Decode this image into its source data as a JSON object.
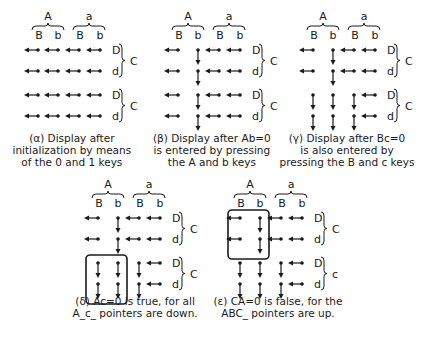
{
  "colors": {
    "ink": "#1a1a1a",
    "background": "#ffffff"
  },
  "labels": {
    "top_groups": [
      "A",
      "a"
    ],
    "sub_columns": [
      "B",
      "b",
      "B",
      "b"
    ],
    "right_rows": [
      "D",
      "d",
      "D",
      "d"
    ],
    "right_groups": [
      "C",
      "C"
    ],
    "right_groups_alt": [
      "C",
      "c"
    ]
  },
  "panels": [
    {
      "id": "alpha",
      "x": 20,
      "y": 12,
      "caption_lines": [
        "(α) Display after",
        "initialization by means",
        "of the 0 and 1 keys"
      ],
      "caption_x": 72,
      "caption_y": 132,
      "second_group_label": "C",
      "pointers": [
        [
          "L",
          "L",
          "L",
          "L"
        ],
        [
          "L",
          "L",
          "L",
          "L"
        ],
        [
          "L",
          "L",
          "L",
          "L"
        ],
        [
          "L",
          "L",
          "L",
          "L"
        ]
      ],
      "box": null
    },
    {
      "id": "beta",
      "x": 160,
      "y": 12,
      "caption_lines": [
        "(β) Display after Ab=0",
        "is entered by pressing",
        "the A and b keys"
      ],
      "caption_x": 212,
      "caption_y": 132,
      "second_group_label": "C",
      "pointers": [
        [
          "L",
          "D",
          "L",
          "L"
        ],
        [
          "L",
          "D",
          "L",
          "L"
        ],
        [
          "L",
          "D",
          "L",
          "L"
        ],
        [
          "L",
          "D",
          "L",
          "L"
        ]
      ],
      "box": null
    },
    {
      "id": "gamma",
      "x": 295,
      "y": 12,
      "caption_lines": [
        "(γ) Display after Bc=0",
        "is also entered by",
        "pressing the B and c keys"
      ],
      "caption_x": 347,
      "caption_y": 132,
      "second_group_label": "C",
      "pointers": [
        [
          "L",
          "D",
          "L",
          "L"
        ],
        [
          "L",
          "D",
          "L",
          "L"
        ],
        [
          "D",
          "D",
          "D",
          "L"
        ],
        [
          "D",
          "D",
          "D",
          "L"
        ]
      ],
      "box": null
    },
    {
      "id": "delta",
      "x": 80,
      "y": 180,
      "caption_lines": [
        "(δ) Ac=0 is true, for all",
        "A_c_ pointers are down."
      ],
      "caption_x": 135,
      "caption_y": 295,
      "second_group_label": "C",
      "pointers": [
        [
          "L",
          "D",
          "L",
          "L"
        ],
        [
          "L",
          "D",
          "L",
          "L"
        ],
        [
          "D",
          "D",
          "D",
          "L"
        ],
        [
          "D",
          "D",
          "D",
          "L"
        ]
      ],
      "box": {
        "col_start": 0,
        "col_end": 1,
        "row_start": 2,
        "row_end": 3
      }
    },
    {
      "id": "epsilon",
      "x": 222,
      "y": 180,
      "caption_lines": [
        "(ε) CA=0 is false, for the",
        "ABC_ pointers are up."
      ],
      "caption_x": 278,
      "caption_y": 295,
      "second_group_label": "c",
      "pointers": [
        [
          "L",
          "D",
          "L",
          "L"
        ],
        [
          "L",
          "D",
          "L",
          "L"
        ],
        [
          "D",
          "D",
          "D",
          "L"
        ],
        [
          "D",
          "D",
          "D",
          "L"
        ]
      ],
      "box": {
        "col_start": 0,
        "col_end": 1,
        "row_start": 0,
        "row_end": 1
      }
    }
  ]
}
